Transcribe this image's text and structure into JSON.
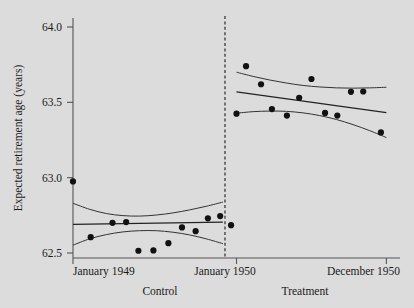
{
  "chart_data": {
    "type": "scatter",
    "title": "",
    "xlabel": "",
    "ylabel": "Expected retirement age (years)",
    "ylim": [
      62.42,
      64.05
    ],
    "xlim": [
      0,
      24
    ],
    "grid": false,
    "legend": null,
    "y_ticks": [
      "62.5",
      "63.0",
      "63.5",
      "64.0"
    ],
    "y_tick_values": [
      62.5,
      63.0,
      63.5,
      64.0
    ],
    "x_ticks": [
      "January 1949",
      "January 1950",
      "December 1950"
    ],
    "x_tick_values": [
      0,
      12,
      23
    ],
    "annotations": {
      "cutoff_line": "vertical dashed line at January 1950",
      "cutoff_x": 12
    },
    "panels": [
      {
        "name": "Control",
        "label": "Control",
        "x_range": [
          0,
          11
        ],
        "points": [
          {
            "x": 0.0,
            "y": 62.975
          },
          {
            "x": 1.3,
            "y": 62.605
          },
          {
            "x": 2.9,
            "y": 62.7
          },
          {
            "x": 3.9,
            "y": 62.705
          },
          {
            "x": 4.8,
            "y": 62.515
          },
          {
            "x": 5.9,
            "y": 62.517
          },
          {
            "x": 7.0,
            "y": 62.565
          },
          {
            "x": 8.0,
            "y": 62.67
          },
          {
            "x": 9.0,
            "y": 62.645
          },
          {
            "x": 9.9,
            "y": 62.73
          },
          {
            "x": 10.8,
            "y": 62.745
          },
          {
            "x": 11.6,
            "y": 62.685
          }
        ],
        "fit_line": {
          "y_start": 62.69,
          "y_end": 62.705,
          "description": "flat OLS fit"
        },
        "ci_upper": [
          62.83,
          62.79,
          62.762,
          62.748,
          62.745,
          62.752,
          62.766,
          62.786,
          62.81,
          62.838
        ],
        "ci_lower": [
          62.552,
          62.594,
          62.622,
          62.64,
          62.648,
          62.648,
          62.638,
          62.62,
          62.594,
          62.562
        ]
      },
      {
        "name": "Treatment",
        "label": "Treatment",
        "x_range": [
          12,
          23
        ],
        "points": [
          {
            "x": 12.0,
            "y": 63.425
          },
          {
            "x": 12.7,
            "y": 63.74
          },
          {
            "x": 13.8,
            "y": 63.62
          },
          {
            "x": 14.6,
            "y": 63.455
          },
          {
            "x": 15.7,
            "y": 63.412
          },
          {
            "x": 16.6,
            "y": 63.53
          },
          {
            "x": 17.5,
            "y": 63.655
          },
          {
            "x": 18.5,
            "y": 63.43
          },
          {
            "x": 19.4,
            "y": 63.412
          },
          {
            "x": 20.4,
            "y": 63.57
          },
          {
            "x": 21.3,
            "y": 63.572
          },
          {
            "x": 22.6,
            "y": 63.3
          }
        ],
        "fit_line": {
          "y_start": 63.57,
          "y_end": 63.432,
          "description": "downward-sloping OLS fit"
        },
        "ci_upper": [
          63.7,
          63.672,
          63.648,
          63.628,
          63.612,
          63.602,
          63.596,
          63.594,
          63.596,
          63.6
        ],
        "ci_lower": [
          63.428,
          63.438,
          63.442,
          63.44,
          63.43,
          63.412,
          63.386,
          63.352,
          63.312,
          63.266
        ]
      }
    ]
  },
  "style": {
    "background": "#dcdcdc",
    "ink": "#1a1a1a",
    "point_color": "#111111",
    "line_color": "#333333",
    "axis_color": "#555555"
  }
}
